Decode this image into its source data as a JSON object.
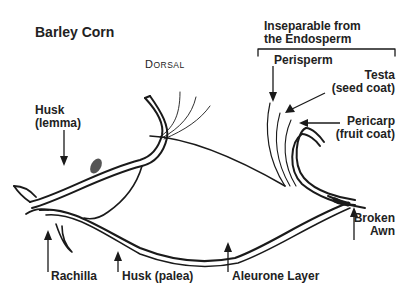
{
  "title": "Barley Corn",
  "orientation_label": {
    "first": "D",
    "rest": "ORSAL"
  },
  "group_label": {
    "line1": "Inseparable from",
    "line2": "the Endosperm"
  },
  "labels": {
    "perisperm": "Perisperm",
    "testa": {
      "line1": "Testa",
      "line2": "(seed coat)"
    },
    "pericarp": {
      "line1": "Pericarp",
      "line2": "(fruit coat)"
    },
    "husk_lemma": {
      "line1": "Husk",
      "line2": "(lemma)"
    },
    "rachilla": "Rachilla",
    "husk_palea": "Husk (palea)",
    "aleurone": "Aleurone Layer",
    "broken_awn": {
      "line1": "Broken",
      "line2": "Awn"
    }
  },
  "colors": {
    "ink": "#1a1a1a",
    "background": "#ffffff"
  }
}
